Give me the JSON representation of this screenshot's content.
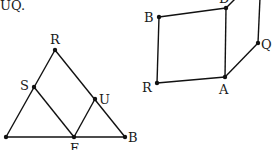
{
  "header_text": "UQ.",
  "figure_left": {
    "type": "triangle",
    "points": {
      "R": [
        55,
        50
      ],
      "L": [
        6,
        137
      ],
      "B": [
        125,
        137
      ],
      "S": [
        34,
        87
      ],
      "U": [
        95,
        99
      ],
      "E": [
        74,
        137
      ]
    },
    "labels": {
      "R": "R",
      "S": "S",
      "U": "U",
      "B": "B",
      "E": "E"
    },
    "segments": [
      [
        "L",
        "R"
      ],
      [
        "R",
        "B"
      ],
      [
        "L",
        "B"
      ],
      [
        "S",
        "E"
      ],
      [
        "E",
        "U"
      ]
    ]
  },
  "figure_right": {
    "type": "prism",
    "points": {
      "B": [
        159,
        17
      ],
      "D": [
        226,
        8
      ],
      "R": [
        157,
        83
      ],
      "A": [
        225,
        77
      ],
      "Q": [
        258,
        43
      ],
      "T": [
        260,
        -2
      ]
    },
    "labels": {
      "B": "B",
      "D": "D",
      "R": "R",
      "A": "A",
      "Q": "Q"
    },
    "segments": [
      [
        "B",
        "D"
      ],
      [
        "B",
        "R"
      ],
      [
        "R",
        "A"
      ],
      [
        "D",
        "A"
      ],
      [
        "A",
        "Q"
      ],
      [
        "Q",
        "T"
      ],
      [
        "D",
        "T"
      ]
    ]
  },
  "colors": {
    "ink": "#111111",
    "background": "#ffffff"
  }
}
